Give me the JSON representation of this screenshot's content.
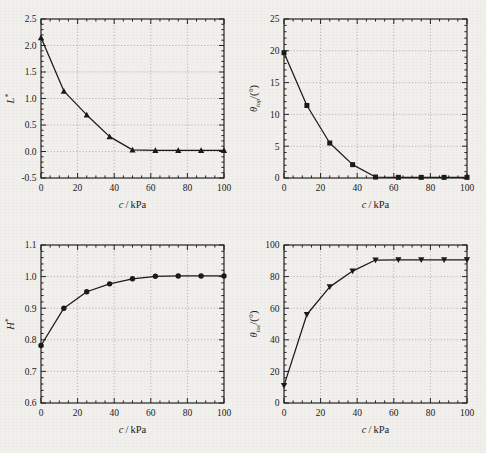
{
  "figure": {
    "background_color": "#f2f0ed",
    "ink_color": "#1a1a1a",
    "panel_count": 4
  },
  "chart_data": [
    {
      "id": "panel-a",
      "type": "line",
      "title": "",
      "xlabel": "c/kPa",
      "ylabel": "L*",
      "ylabel_parts": {
        "symbol": "L",
        "sup": "*"
      },
      "xlim": [
        0,
        100
      ],
      "ylim": [
        -0.5,
        2.5
      ],
      "xticks": [
        0,
        20,
        40,
        60,
        80,
        100
      ],
      "yticks": [
        -0.5,
        0.0,
        0.5,
        1.0,
        1.5,
        2.0,
        2.5
      ],
      "xtick_labels": [
        "0",
        "20",
        "40",
        "60",
        "80",
        "100"
      ],
      "ytick_labels": [
        "-0.5",
        "0.0",
        "0.5",
        "1.0",
        "1.5",
        "2.0",
        "2.5"
      ],
      "xminor_step": 5,
      "yminor_step": 0.1,
      "grid": true,
      "legend": "none",
      "marker": "triangle-up",
      "x": [
        0,
        12.5,
        25,
        37.5,
        50,
        62.5,
        75,
        87.5,
        100
      ],
      "values": [
        2.15,
        1.14,
        0.69,
        0.28,
        0.03,
        0.02,
        0.02,
        0.02,
        0.02
      ]
    },
    {
      "id": "panel-b",
      "type": "line",
      "title": "",
      "xlabel": "c/kPa",
      "ylabel": "θtop/(°)",
      "ylabel_parts": {
        "symbol": "θ",
        "sub": "top",
        "rest": "/(°)"
      },
      "xlim": [
        0,
        100
      ],
      "ylim": [
        0,
        25
      ],
      "xticks": [
        0,
        20,
        40,
        60,
        80,
        100
      ],
      "yticks": [
        0,
        5,
        10,
        15,
        20,
        25
      ],
      "xtick_labels": [
        "0",
        "20",
        "40",
        "60",
        "80",
        "100"
      ],
      "ytick_labels": [
        "0",
        "5",
        "10",
        "15",
        "20",
        "25"
      ],
      "xminor_step": 5,
      "yminor_step": 1,
      "grid": true,
      "legend": "none",
      "marker": "square",
      "x": [
        0,
        12.5,
        25,
        37.5,
        50,
        62.5,
        75,
        87.5,
        100
      ],
      "values": [
        19.7,
        11.4,
        5.5,
        2.1,
        0.15,
        0.1,
        0.1,
        0.1,
        0.1
      ]
    },
    {
      "id": "panel-c",
      "type": "line",
      "title": "",
      "xlabel": "c/kPa",
      "ylabel": "H*",
      "ylabel_parts": {
        "symbol": "H",
        "sup": "*"
      },
      "xlim": [
        0,
        100
      ],
      "ylim": [
        0.6,
        1.1
      ],
      "xticks": [
        0,
        20,
        40,
        60,
        80,
        100
      ],
      "yticks": [
        0.6,
        0.7,
        0.8,
        0.9,
        1.0,
        1.1
      ],
      "xtick_labels": [
        "0",
        "20",
        "40",
        "60",
        "80",
        "100"
      ],
      "ytick_labels": [
        "0.6",
        "0.7",
        "0.8",
        "0.9",
        "1.0",
        "1.1"
      ],
      "xminor_step": 5,
      "yminor_step": 0.02,
      "grid": true,
      "legend": "none",
      "marker": "circle",
      "x": [
        0,
        12.5,
        25,
        37.5,
        50,
        62.5,
        75,
        87.5,
        100
      ],
      "values": [
        0.782,
        0.9,
        0.952,
        0.977,
        0.993,
        1.001,
        1.002,
        1.002,
        1.002
      ]
    },
    {
      "id": "panel-d",
      "type": "line",
      "title": "",
      "xlabel": "c/kPa",
      "ylabel": "θtoe/(°)",
      "ylabel_parts": {
        "symbol": "θ",
        "sub": "toe",
        "rest": "/(°)"
      },
      "xlim": [
        0,
        100
      ],
      "ylim": [
        0,
        100
      ],
      "xticks": [
        0,
        20,
        40,
        60,
        80,
        100
      ],
      "yticks": [
        0,
        20,
        40,
        60,
        80,
        100
      ],
      "xtick_labels": [
        "0",
        "20",
        "40",
        "60",
        "80",
        "100"
      ],
      "ytick_labels": [
        "0",
        "20",
        "40",
        "60",
        "80",
        "100"
      ],
      "xminor_step": 5,
      "yminor_step": 4,
      "grid": true,
      "legend": "none",
      "marker": "triangle-down",
      "x": [
        0,
        12.5,
        25,
        37.5,
        50,
        62.5,
        75,
        87.5,
        100
      ],
      "values": [
        11.0,
        56.0,
        73.5,
        83.5,
        90.5,
        90.6,
        90.6,
        90.6,
        90.6
      ]
    }
  ]
}
